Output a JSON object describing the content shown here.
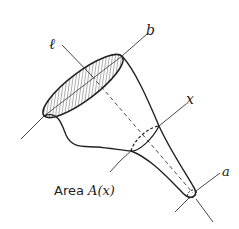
{
  "diagram": {
    "type": "solid-of-revolution-cross-section",
    "labels": {
      "axis_l": "ℓ",
      "end_b": "b",
      "section_x": "x",
      "end_a": "a",
      "caption_prefix": "Area ",
      "caption_func": "A(x)"
    },
    "colors": {
      "stroke": "#222222",
      "background": "#ffffff",
      "hatch": "#333333"
    }
  }
}
